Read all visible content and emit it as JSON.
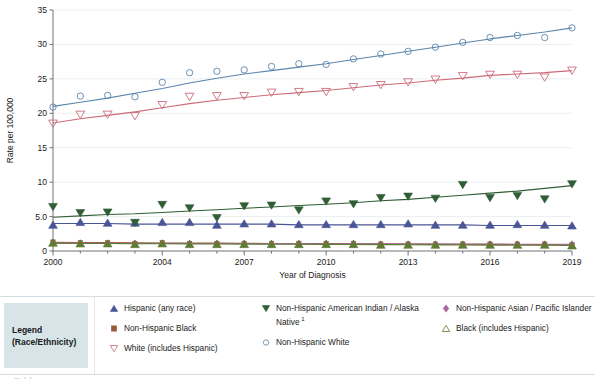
{
  "chart_data": {
    "type": "line",
    "title": "",
    "xlabel": "Year of Diagnosis",
    "ylabel": "Rate per 100,000",
    "xlim": [
      2000,
      2019
    ],
    "ylim": [
      0,
      35
    ],
    "yticks": [
      "0",
      "5.0",
      "10",
      "15",
      "20",
      "25",
      "30",
      "35"
    ],
    "ytick_values": [
      0,
      5,
      10,
      15,
      20,
      25,
      30,
      35
    ],
    "xticks_all": [
      2000,
      2001,
      2002,
      2003,
      2004,
      2005,
      2006,
      2007,
      2008,
      2009,
      2010,
      2011,
      2012,
      2013,
      2014,
      2015,
      2016,
      2017,
      2018,
      2019
    ],
    "xtick_labels": [
      "2000",
      "2004",
      "2007",
      "2010",
      "2013",
      "2016",
      "2019"
    ],
    "xtick_label_values": [
      2000,
      2004,
      2007,
      2010,
      2013,
      2016,
      2019
    ],
    "grid": "horizontal",
    "legend_position": "below",
    "x": [
      2000,
      2001,
      2002,
      2003,
      2004,
      2005,
      2006,
      2007,
      2008,
      2009,
      2010,
      2011,
      2012,
      2013,
      2014,
      2015,
      2016,
      2017,
      2018,
      2019
    ],
    "series": [
      {
        "name": "Non-Hispanic White",
        "marker": "circle-open",
        "color": "#5b85ab",
        "values": [
          20.9,
          22.5,
          22.6,
          22.4,
          24.5,
          25.9,
          26.1,
          26.3,
          26.8,
          27.2,
          27.1,
          27.9,
          28.6,
          29.0,
          29.6,
          30.3,
          31.0,
          31.3,
          31.0,
          32.4
        ],
        "trend": [
          21.0,
          21.6,
          22.2,
          22.9,
          23.6,
          24.4,
          25.1,
          25.7,
          26.2,
          26.7,
          27.2,
          27.8,
          28.4,
          29.0,
          29.6,
          30.2,
          30.8,
          31.3,
          31.8,
          32.4
        ]
      },
      {
        "name": "White (includes Hispanic)",
        "marker": "triangle-down-open",
        "color": "#cc6b78",
        "values": [
          18.5,
          19.8,
          19.8,
          19.6,
          21.2,
          22.4,
          22.5,
          22.5,
          23.0,
          23.1,
          23.1,
          23.8,
          24.1,
          24.5,
          24.9,
          25.4,
          25.6,
          25.6,
          25.2,
          26.2
        ],
        "trend": [
          18.6,
          19.2,
          19.7,
          20.2,
          20.8,
          21.4,
          21.9,
          22.3,
          22.7,
          23.0,
          23.3,
          23.7,
          24.1,
          24.4,
          24.8,
          25.1,
          25.5,
          25.7,
          25.9,
          26.2
        ]
      },
      {
        "name": "Non-Hispanic American Indian / Alaska Native",
        "marker": "triangle-down-filled",
        "color": "#2f5d34",
        "values": [
          6.4,
          5.5,
          5.6,
          4.1,
          6.7,
          6.2,
          4.8,
          6.5,
          6.6,
          5.9,
          7.2,
          6.8,
          7.7,
          7.9,
          7.6,
          9.6,
          7.7,
          8.0,
          7.5,
          9.7
        ],
        "trend": [
          4.9,
          5.1,
          5.3,
          5.4,
          5.6,
          5.8,
          6.0,
          6.2,
          6.4,
          6.6,
          6.8,
          7.0,
          7.3,
          7.5,
          7.8,
          8.1,
          8.4,
          8.7,
          9.1,
          9.5
        ]
      },
      {
        "name": "Hispanic (any race)",
        "marker": "triangle-up-filled",
        "color": "#4a5596",
        "values": [
          3.8,
          4.2,
          4.1,
          4.1,
          4.2,
          4.2,
          3.8,
          4.0,
          4.0,
          3.9,
          3.9,
          3.9,
          3.9,
          4.0,
          3.8,
          3.8,
          3.8,
          3.9,
          3.8,
          3.7
        ],
        "trend": [
          4.0,
          4.0,
          4.0,
          3.9,
          3.9,
          3.9,
          3.9,
          3.9,
          3.9,
          3.8,
          3.8,
          3.8,
          3.8,
          3.8,
          3.8,
          3.8,
          3.7,
          3.7,
          3.7,
          3.7
        ]
      },
      {
        "name": "Non-Hispanic Black",
        "marker": "square-filled",
        "color": "#9a5a3c",
        "values": [
          1.3,
          1.2,
          1.2,
          1.1,
          1.2,
          1.1,
          1.1,
          1.1,
          1.1,
          1.1,
          1.1,
          1.1,
          1.0,
          1.0,
          1.0,
          1.0,
          1.0,
          1.0,
          1.0,
          0.9
        ],
        "trend": [
          1.25,
          1.23,
          1.21,
          1.19,
          1.17,
          1.16,
          1.14,
          1.12,
          1.1,
          1.09,
          1.07,
          1.05,
          1.03,
          1.02,
          1.0,
          0.98,
          0.96,
          0.95,
          0.93,
          0.91
        ]
      },
      {
        "name": "Non-Hispanic Asian / Pacific Islander",
        "marker": "diamond-filled",
        "color": "#a86b9b",
        "values": [
          1.2,
          1.1,
          1.1,
          1.1,
          1.1,
          1.1,
          1.1,
          1.1,
          1.1,
          1.1,
          1.1,
          1.1,
          1.0,
          1.0,
          1.0,
          1.0,
          1.0,
          1.0,
          1.0,
          1.0
        ],
        "trend": [
          1.15,
          1.14,
          1.13,
          1.12,
          1.11,
          1.1,
          1.09,
          1.08,
          1.07,
          1.07,
          1.06,
          1.05,
          1.04,
          1.03,
          1.02,
          1.01,
          1.0,
          0.99,
          0.98,
          0.97
        ]
      },
      {
        "name": "Black (includes Hispanic)",
        "marker": "triangle-up-filled-olive",
        "color": "#5e7a33",
        "values": [
          1.2,
          1.1,
          1.1,
          1.0,
          1.1,
          1.0,
          1.0,
          1.0,
          1.0,
          1.0,
          1.0,
          1.0,
          0.9,
          0.9,
          0.9,
          0.9,
          0.9,
          0.9,
          0.9,
          0.8
        ],
        "trend": [
          1.12,
          1.1,
          1.09,
          1.07,
          1.05,
          1.04,
          1.02,
          1.0,
          0.99,
          0.97,
          0.96,
          0.94,
          0.92,
          0.91,
          0.89,
          0.88,
          0.86,
          0.84,
          0.83,
          0.81
        ]
      }
    ]
  },
  "legend": {
    "title_line1": "Legend",
    "title_line2": "(Race/Ethnicity)",
    "columns": [
      {
        "entries": [
          {
            "label": "Hispanic (any race)",
            "marker": "triangle-up-filled",
            "color": "#4a5596",
            "footnote": ""
          },
          {
            "label": "Non-Hispanic Black",
            "marker": "square-filled",
            "color": "#9a5a3c",
            "footnote": ""
          },
          {
            "label": "White (includes Hispanic)",
            "marker": "triangle-down-open",
            "color": "#cc6b78",
            "footnote": ""
          }
        ]
      },
      {
        "entries": [
          {
            "label": "Non-Hispanic American Indian / Alaska Native",
            "marker": "triangle-down-filled",
            "color": "#2f5d34",
            "footnote": "1"
          },
          {
            "label": "Non-Hispanic White",
            "marker": "circle-open",
            "color": "#5b85ab",
            "footnote": ""
          }
        ]
      },
      {
        "entries": [
          {
            "label": "Non-Hispanic Asian / Pacific Islander",
            "marker": "diamond-filled",
            "color": "#a86b9b",
            "footnote": ""
          },
          {
            "label": "Black (includes Hispanic)",
            "marker": "triangle-up-open",
            "color": "#5e7a33",
            "footnote": ""
          }
        ]
      }
    ]
  },
  "bottom": {
    "partial_text": "Table"
  }
}
